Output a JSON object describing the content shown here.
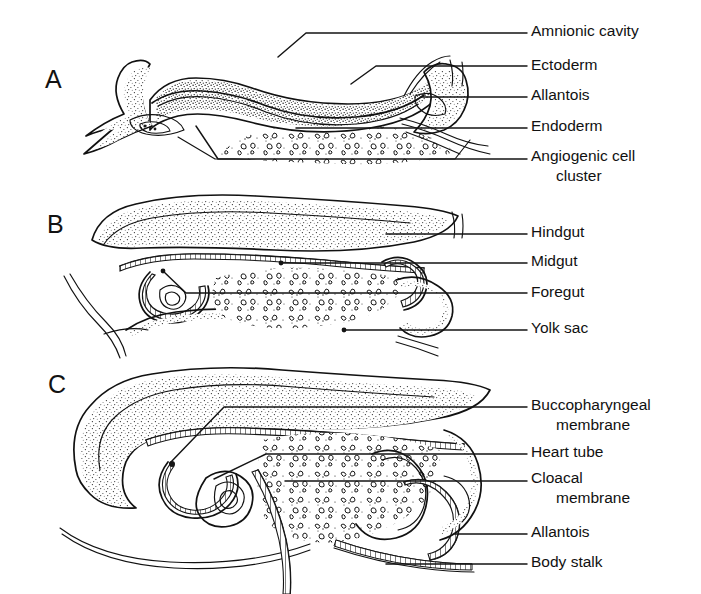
{
  "figure": {
    "background_color": "#ffffff",
    "ink_color": "#111111",
    "width": 701,
    "height": 594
  },
  "panels": [
    {
      "id": "A",
      "letter": "A",
      "letter_x": 45,
      "letter_y": 88,
      "labels": [
        {
          "key": "amnionic-cavity",
          "text": "Amnionic cavity",
          "text_x": 531,
          "text_y": 36,
          "leader": "M 278 57 L 306 33 L 527 33",
          "dot": null
        },
        {
          "key": "ectoderm",
          "text": "Ectoderm",
          "text_x": 531,
          "text_y": 70,
          "leader": "M 351 84 L 376 66 L 527 66",
          "dot": null
        },
        {
          "key": "allantois",
          "text": "Allantois",
          "text_x": 531,
          "text_y": 100,
          "leader": "M 421 97 L 527 97",
          "dot": null
        },
        {
          "key": "endoderm",
          "text": "Endoderm",
          "text_x": 531,
          "text_y": 131,
          "leader": "M 296 128 L 527 128",
          "dot": null
        },
        {
          "key": "angiogenic-cell-cluster",
          "text": "Angiogenic cell",
          "text_x": 531,
          "text_y": 161,
          "leader": "M 196 126 L 218 159 L 527 159",
          "dot": null
        },
        {
          "key": "angiogenic-cell-cluster-line2",
          "text": "cluster",
          "text_x": 556,
          "text_y": 181,
          "leader": null,
          "dot": null
        }
      ]
    },
    {
      "id": "B",
      "letter": "B",
      "letter_x": 47,
      "letter_y": 233,
      "labels": [
        {
          "key": "hindgut",
          "text": "Hindgut",
          "text_x": 531,
          "text_y": 237,
          "leader": "M 386 234 L 527 234",
          "dot": null
        },
        {
          "key": "midgut",
          "text": "Midgut",
          "text_x": 531,
          "text_y": 266,
          "leader": "M 281 263 L 527 263",
          "dot": [
            281,
            263
          ]
        },
        {
          "key": "foregut",
          "text": "Foregut",
          "text_x": 531,
          "text_y": 297,
          "leader": "M 163 271 L 186 293 L 527 293",
          "dot": [
            163,
            271
          ]
        },
        {
          "key": "yolk-sac",
          "text": "Yolk sac",
          "text_x": 531,
          "text_y": 333,
          "leader": "M 344 330 L 527 330",
          "dot": [
            344,
            330
          ]
        }
      ]
    },
    {
      "id": "C",
      "letter": "C",
      "letter_x": 48,
      "letter_y": 393,
      "labels": [
        {
          "key": "buccopharyngeal-membrane",
          "text": "Buccopharyngeal",
          "text_x": 531,
          "text_y": 410,
          "leader": "M 170 463 L 224 407 L 527 407",
          "dot": null
        },
        {
          "key": "buccopharyngeal-membrane-line2",
          "text": "membrane",
          "text_x": 556,
          "text_y": 430,
          "leader": null,
          "dot": null
        },
        {
          "key": "heart-tube",
          "text": "Heart tube",
          "text_x": 531,
          "text_y": 457,
          "leader": "M 214 479 L 266 454 L 527 454",
          "dot": null
        },
        {
          "key": "cloacal-membrane",
          "text": "Cloacal",
          "text_x": 531,
          "text_y": 483,
          "leader": "M 285 481 L 527 481",
          "dot": null
        },
        {
          "key": "cloacal-membrane-line2",
          "text": "membrane",
          "text_x": 556,
          "text_y": 503,
          "leader": null,
          "dot": null
        },
        {
          "key": "allantois-c",
          "text": "Allantois",
          "text_x": 531,
          "text_y": 537,
          "leader": "M 455 534 L 527 534",
          "dot": null
        },
        {
          "key": "body-stalk",
          "text": "Body stalk",
          "text_x": 531,
          "text_y": 567,
          "leader": "M 386 564 L 527 564",
          "dot": null
        }
      ]
    }
  ]
}
